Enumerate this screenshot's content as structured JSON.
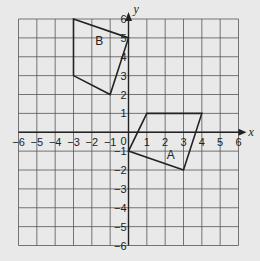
{
  "chart_data": {
    "type": "scatter",
    "title": "",
    "xlabel": "x",
    "ylabel": "y",
    "xlim": [
      -6,
      6
    ],
    "ylim": [
      -6,
      6
    ],
    "grid": true,
    "x_ticks": [
      -6,
      -5,
      -4,
      -3,
      -2,
      -1,
      0,
      1,
      2,
      3,
      4,
      5,
      6
    ],
    "y_ticks": [
      -6,
      -5,
      -4,
      -3,
      -2,
      -1,
      1,
      2,
      3,
      4,
      5,
      6
    ],
    "origin_label": "0",
    "shapes": [
      {
        "name": "A",
        "vertices": [
          [
            0,
            -1
          ],
          [
            1,
            1
          ],
          [
            4,
            1
          ],
          [
            3,
            -2
          ]
        ],
        "label_pos": [
          2.3,
          -1.4
        ]
      },
      {
        "name": "B",
        "vertices": [
          [
            -3,
            6
          ],
          [
            0,
            5
          ],
          [
            -1,
            2
          ],
          [
            -3,
            3
          ]
        ],
        "label_pos": [
          -1.6,
          4.6
        ]
      }
    ]
  }
}
